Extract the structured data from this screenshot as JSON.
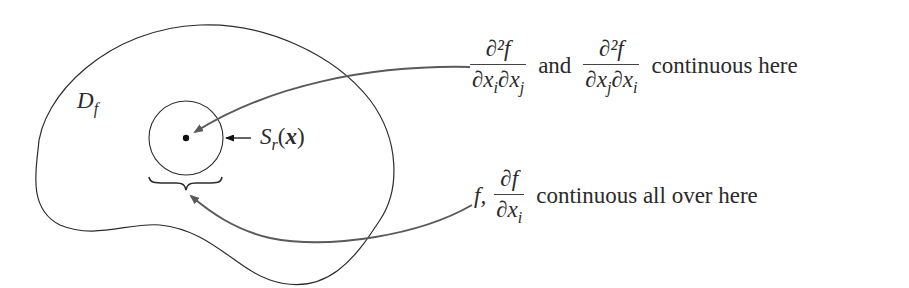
{
  "diagram": {
    "region_label": {
      "main": "D",
      "sub": "f"
    },
    "ball_label": {
      "main": "S",
      "sub": "r",
      "arg": "x"
    },
    "upper_annotation": {
      "frac1": {
        "numerator": "∂²f",
        "denominator_parts": [
          "∂x",
          "i",
          "∂x",
          "j"
        ]
      },
      "connector": "and",
      "frac2": {
        "numerator": "∂²f",
        "denominator_parts": [
          "∂x",
          "j",
          "∂x",
          "i"
        ]
      },
      "tail": "continuous here"
    },
    "lower_annotation": {
      "lead": "f,",
      "frac": {
        "numerator": "∂f",
        "denominator_parts": [
          "∂x",
          "i"
        ]
      },
      "tail": "continuous all over here"
    },
    "colors": {
      "outline": "#2b2b2b",
      "arrow": "#5a5a5a",
      "text": "#2a2a2a",
      "background": "#ffffff"
    }
  }
}
